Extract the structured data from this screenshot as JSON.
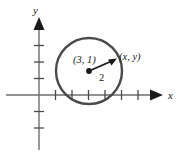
{
  "figure": {
    "background_color": "#ffffff",
    "axis_color": "#6e6e6e",
    "axis_arrow_color": "#1a1a1a",
    "circle_color": "#4a4a4a",
    "radius_arrow_color": "#1a1a1a",
    "text_color": "#1a1a1a"
  },
  "axes": {
    "x_label": "x",
    "y_label": "y",
    "x_tick_count": 7,
    "y_tick_count": 5,
    "origin": {
      "x": 39,
      "y": 95
    },
    "tick_spacing": 16.5
  },
  "circle": {
    "center_label": "(3, 1)",
    "center_x": 3,
    "center_y": 1,
    "radius_label": "2",
    "radius_value": 2,
    "point_label": "(x, y)",
    "center_px": {
      "x": 89,
      "y": 71
    },
    "radius_px": 33
  },
  "radius_arrow": {
    "from_px": {
      "x": 89,
      "y": 71
    },
    "to_px": {
      "x": 116,
      "y": 59
    }
  }
}
